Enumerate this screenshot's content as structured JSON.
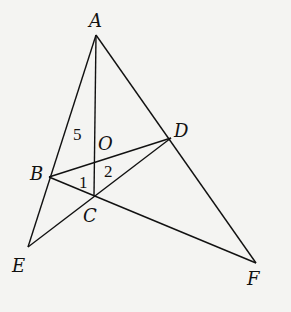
{
  "diagram": {
    "points": {
      "A": {
        "x": 96,
        "y": 35,
        "label": "A",
        "lx": 89,
        "ly": 27
      },
      "B": {
        "x": 49,
        "y": 177,
        "label": "B",
        "lx": 30,
        "ly": 180
      },
      "C": {
        "x": 94,
        "y": 195,
        "label": "C",
        "lx": 83,
        "ly": 222
      },
      "D": {
        "x": 171,
        "y": 138,
        "label": "D",
        "lx": 174,
        "ly": 137
      },
      "E": {
        "x": 28,
        "y": 247,
        "label": "E",
        "lx": 12,
        "ly": 272
      },
      "F": {
        "x": 256,
        "y": 263,
        "label": "F",
        "lx": 247,
        "ly": 285
      },
      "O": {
        "x": 95,
        "y": 161,
        "label": "O",
        "lx": 98,
        "ly": 150
      }
    },
    "segments": [
      [
        "A",
        "C"
      ],
      [
        "A",
        "E"
      ],
      [
        "A",
        "F"
      ],
      [
        "B",
        "D"
      ],
      [
        "B",
        "F"
      ],
      [
        "E",
        "D"
      ]
    ],
    "angle_labels": [
      {
        "text": "5",
        "x": 73,
        "y": 140
      },
      {
        "text": "1",
        "x": 79,
        "y": 188
      },
      {
        "text": "2",
        "x": 104,
        "y": 177
      }
    ]
  }
}
